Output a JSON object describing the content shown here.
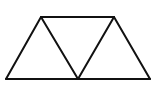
{
  "diagram": {
    "stroke_color": "#111111",
    "background": "#ffffff",
    "vertices": {
      "A": [
        41,
        17
      ],
      "B": [
        114,
        17
      ],
      "C": [
        150,
        79
      ],
      "D": [
        78,
        79
      ],
      "E": [
        6,
        79
      ]
    },
    "segments": [
      [
        "A",
        "B"
      ],
      [
        "B",
        "C"
      ],
      [
        "C",
        "E"
      ],
      [
        "E",
        "A"
      ],
      [
        "A",
        "D"
      ],
      [
        "D",
        "B"
      ]
    ],
    "triangles": [
      [
        "E",
        "A",
        "D"
      ],
      [
        "A",
        "B",
        "D"
      ],
      [
        "D",
        "B",
        "C"
      ]
    ]
  }
}
